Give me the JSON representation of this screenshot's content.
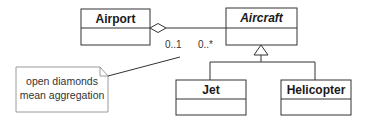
{
  "diagram": {
    "type": "uml-class-diagram",
    "classes": [
      {
        "id": "airport",
        "name": "Airport",
        "abstract": false
      },
      {
        "id": "aircraft",
        "name": "Aircraft",
        "abstract": true
      },
      {
        "id": "jet",
        "name": "Jet",
        "abstract": false
      },
      {
        "id": "helicopter",
        "name": "Helicopter",
        "abstract": false
      }
    ],
    "relationships": [
      {
        "type": "aggregation",
        "whole": "Airport",
        "part": "Aircraft",
        "whole_multiplicity": "0..1",
        "part_multiplicity": "0..*"
      },
      {
        "type": "generalization",
        "parent": "Aircraft",
        "children": [
          "Jet",
          "Helicopter"
        ]
      }
    ],
    "multiplicities": {
      "airport_end": "0..1",
      "aircraft_end": "0..*"
    },
    "note": {
      "line1": "open diamonds",
      "line2": "mean aggregation"
    },
    "colors": {
      "line": "#333333",
      "note_border": "#9a9a9a",
      "background": "#ffffff"
    }
  }
}
